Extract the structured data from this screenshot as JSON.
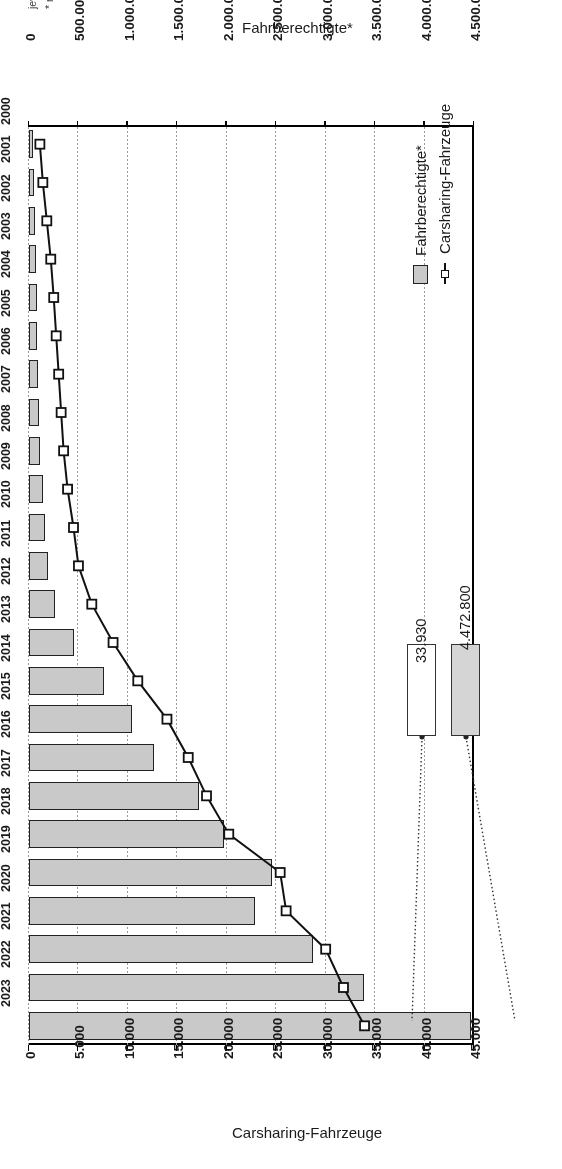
{
  "chart_data": {
    "type": "bar",
    "title": "",
    "orientation": "horizontal",
    "categories": [
      "2000",
      "2001",
      "2002",
      "2003",
      "2004",
      "2005",
      "2006",
      "2007",
      "2008",
      "2009",
      "2010",
      "2011",
      "2012",
      "2013",
      "2014",
      "2015",
      "2016",
      "2017",
      "2018",
      "2019",
      "2020",
      "2021",
      "2022",
      "2023"
    ],
    "series": [
      {
        "name": "Fahrberechtigte*",
        "axis": "bottom",
        "unit": "Fahrberechtigte",
        "color": "#c9c9c9",
        "values": [
          45000,
          54000,
          60000,
          70000,
          80000,
          85000,
          95000,
          100000,
          115000,
          137000,
          158000,
          190000,
          262000,
          453000,
          757000,
          1040000,
          1260000,
          1715000,
          1970000,
          2460000,
          2290000,
          2870000,
          3390000,
          4472800
        ]
      },
      {
        "name": "Carsharing-Fahrzeuge",
        "axis": "top",
        "unit": "Fahrzeuge",
        "color": "#ffffff",
        "values": [
          1100,
          1400,
          1800,
          2200,
          2500,
          2750,
          3000,
          3250,
          3500,
          3900,
          4500,
          5000,
          6350,
          8500,
          11000,
          13950,
          16100,
          17950,
          20200,
          25400,
          26000,
          30000,
          31800,
          33930
        ]
      }
    ],
    "top_axis": {
      "label": "Carsharing-Fahrzeuge",
      "ticks": [
        "45.000",
        "40.000",
        "35.000",
        "30.000",
        "25.000",
        "20.000",
        "15.000",
        "10.000",
        "5.000",
        "0"
      ],
      "min": 0,
      "max": 45000,
      "step": 5000,
      "direction": "right-to-left"
    },
    "bottom_axis": {
      "label": "Fahrberechtigte*",
      "ticks": [
        "4.500.000",
        "4.000.000",
        "3.500.000",
        "3.000.000",
        "2.500.000",
        "2.000.000",
        "1.500.000",
        "1.000.000",
        "500.000",
        "0"
      ],
      "min": 0,
      "max": 4500000,
      "step": 500000,
      "direction": "right-to-left"
    },
    "grid": true,
    "legend_position": "inside-left",
    "annotations": [
      {
        "name": "fahrberechtigte-2023",
        "text": "4.472.800",
        "style": "gray"
      },
      {
        "name": "fahrzeuge-2023",
        "text": "33.930",
        "style": "white"
      }
    ]
  },
  "legend": {
    "items": [
      {
        "label": "Fahrberechtigte*",
        "marker": "gray-square-swatch"
      },
      {
        "label": "Carsharing-Fahrzeuge",
        "marker": "line-with-open-square-marker"
      }
    ]
  },
  "callouts": {
    "fahrberechtigte": "4.472.800",
    "fahrzeuge": "33.930"
  },
  "axis_titles": {
    "top": "Carsharing-Fahrzeuge",
    "bottom": "Fahrberechtigte*"
  },
  "notes": {
    "line1": "jeweils zum 01.01. des Jahres",
    "line2": "* nicht überschneidungsfrei - Fahrberechtigte, die sich bei mehreren Anbietern angemeldet haben, werden mehrfach gezählt."
  }
}
